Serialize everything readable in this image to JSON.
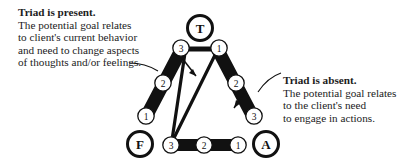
{
  "figure": {
    "type": "triangle-sequence-diagram",
    "background_color": "#ffffff",
    "ink_color": "#111111"
  },
  "callouts": {
    "left": {
      "name": "triad-present-callout",
      "lead": "Triad is present.",
      "lines": [
        "The potential goal relates",
        "to client's current behavior",
        "and need to change aspects",
        "of thoughts and/or feelings."
      ]
    },
    "right": {
      "name": "triad-absent-callout",
      "lead": "Triad is absent.",
      "lines": [
        "The potential goal relates",
        "to the client's need",
        "to engage in actions."
      ]
    }
  },
  "diagram": {
    "vertices": [
      {
        "id": "T",
        "label": "T",
        "position": "apex",
        "cx": 200,
        "cy": 28
      },
      {
        "id": "F",
        "label": "F",
        "position": "bottom-left",
        "cx": 140,
        "cy": 144
      },
      {
        "id": "A",
        "label": "A",
        "position": "bottom-right",
        "cx": 266,
        "cy": 144
      }
    ],
    "edges": [
      {
        "id": "left-leg",
        "from": "F",
        "to": "T",
        "style": "thick-black-bar",
        "steps": [
          {
            "label": "3",
            "end": "top"
          },
          {
            "label": "2",
            "end": "middle"
          },
          {
            "label": "1",
            "end": "bottom"
          }
        ]
      },
      {
        "id": "right-leg",
        "from": "T",
        "to": "A",
        "style": "thick-black-bar",
        "steps": [
          {
            "label": "1",
            "end": "top"
          },
          {
            "label": "2",
            "end": "middle"
          },
          {
            "label": "3",
            "end": "bottom"
          }
        ]
      },
      {
        "id": "bottom-bar",
        "from": "F",
        "to": "A",
        "style": "thick-black-bar",
        "steps": [
          {
            "label": "3",
            "end": "left"
          },
          {
            "label": "2",
            "end": "middle"
          },
          {
            "label": "1",
            "end": "right"
          }
        ]
      }
    ],
    "apex_connector": {
      "id": "apex-bar",
      "style": "short-horizontal-bar",
      "connects": [
        "left-leg-3",
        "right-leg-1"
      ]
    },
    "inner_arrows": [
      {
        "id": "inner-arrow-left",
        "direction": "down-right",
        "note": "arrow inside triangle near left leg"
      },
      {
        "id": "inner-arrow-right",
        "direction": "down-left",
        "note": "arrow along right leg toward A"
      }
    ],
    "inner_lines": [
      {
        "id": "inner-line-a",
        "from": "bottom-left-3",
        "to": "apex-left-3"
      },
      {
        "id": "inner-line-b",
        "from": "bottom-left-3",
        "to": "apex-right-1"
      }
    ],
    "leader_lines": [
      {
        "id": "leader-left",
        "from": "triad-present-callout",
        "to": "left-leg"
      },
      {
        "id": "leader-right",
        "from": "triad-absent-callout",
        "to": "right-leg"
      }
    ]
  }
}
